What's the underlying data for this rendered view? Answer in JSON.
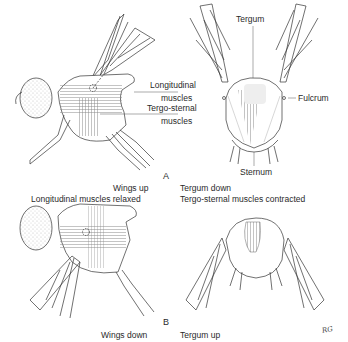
{
  "figure": {
    "panels": [
      {
        "letter": "A",
        "lateral_labels": {
          "longitudinal_line1": "Longitudinal",
          "longitudinal_line2": "muscles",
          "tergosternal_line1": "Tergo-sternal",
          "tergosternal_line2": "muscles"
        },
        "frontal_labels": {
          "tergum": "Tergum",
          "fulcrum": "Fulcrum",
          "sternum": "Sternum"
        }
      },
      {
        "letter": "B"
      }
    ],
    "captions": {
      "a_left_line1": "Wings up",
      "a_left_line2": "Longitudinal muscles relaxed",
      "a_right_line1": "Tergum down",
      "a_right_line2": "Tergo-sternal muscles contracted",
      "b_left_line1": "Wings down",
      "b_right_line1": "Tergum up"
    },
    "signature": "RG"
  }
}
